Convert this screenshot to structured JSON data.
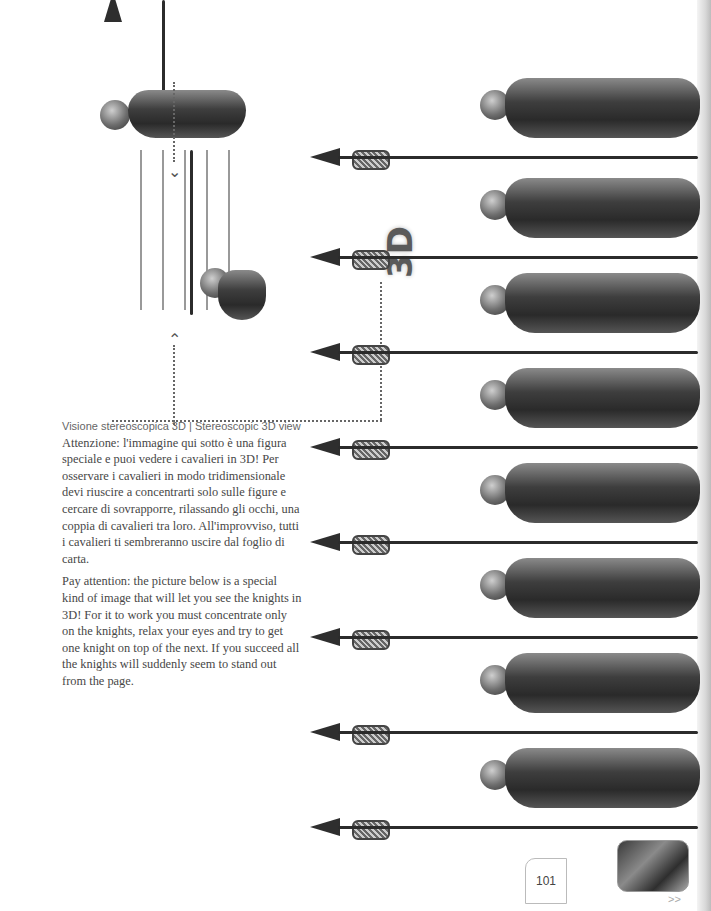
{
  "page": {
    "number": "101",
    "next_label": ">>"
  },
  "title": "3D",
  "section": {
    "heading_it": "Visione stereoscopica 3D",
    "separator": " | ",
    "heading_en": "Stereoscopic 3D view",
    "paragraph_it": "Attenzione: l'immagine qui sotto è una figura speciale e puoi vedere i cavalieri in 3D! Per osservare i cavalieri in modo tridimensionale devi riuscire a concentrarti solo sulle figure e cercare di sovrapporre, rilassando gli occhi, una coppia di cavalieri tra loro. All'improvviso, tutti i cavalieri ti sembreranno uscire dal foglio di carta.",
    "paragraph_en": "Pay attention: the picture below is a special kind of image that will let you see the knights in 3D! For it to work you must concentrate only on the knights, relax your eyes and try to get one knight on top of the next. If you succeed all the knights will suddenly seem to stand out from the page."
  },
  "illustration": {
    "knight_count": 8,
    "icons": [
      "knight-figure",
      "spear",
      "dotted-arrow-up",
      "dotted-arrow-down"
    ]
  },
  "colors": {
    "text": "#474747",
    "title": "#5a5a5a",
    "armor_dark": "#2a2a2a",
    "page_edge": "#bcbcbc"
  }
}
